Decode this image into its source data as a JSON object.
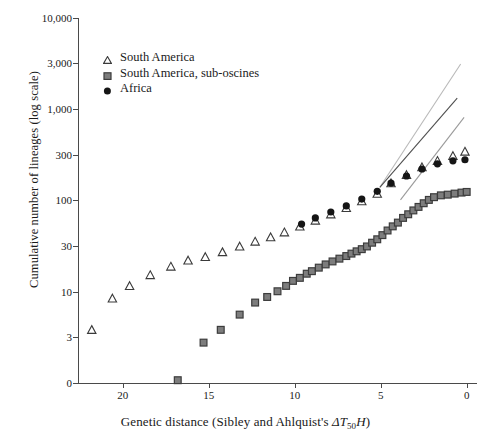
{
  "chart_data": {
    "type": "scatter",
    "title": "",
    "xlabel": "Genetic distance (Sibley and Ahlquist's ΔT50H)",
    "ylabel": "Cumulative number of lineages (log scale)",
    "xlim": [
      22.6,
      -0.6
    ],
    "x_reversed": true,
    "xticks": [
      20,
      15,
      10,
      5,
      0
    ],
    "xtick_labels": [
      "20",
      "15",
      "10",
      "5",
      "0"
    ],
    "yscale": "log",
    "ylim": [
      1,
      10000
    ],
    "yticks": [
      10000,
      3000,
      1000,
      300,
      100,
      30,
      10,
      3,
      0
    ],
    "ytick_labels": [
      "10,000",
      "3,000",
      "1,000",
      "300",
      "100",
      "30",
      "10",
      "3",
      "0"
    ],
    "grid": false,
    "legend_position": "upper-left",
    "series": [
      {
        "name": "South America",
        "marker": "triangle",
        "color": "#ffffff",
        "edge_color": "#3a3a3a",
        "points": [
          [
            21.8,
            3.6
          ],
          [
            20.6,
            8.0
          ],
          [
            19.6,
            11.0
          ],
          [
            18.4,
            14.5
          ],
          [
            17.2,
            18.0
          ],
          [
            16.2,
            21.0
          ],
          [
            15.2,
            23.0
          ],
          [
            14.2,
            26.0
          ],
          [
            13.2,
            30.0
          ],
          [
            12.3,
            34.0
          ],
          [
            11.4,
            38.0
          ],
          [
            10.6,
            43.0
          ],
          [
            9.7,
            50.0
          ],
          [
            8.8,
            58.0
          ],
          [
            7.9,
            68.0
          ],
          [
            7.0,
            80.0
          ],
          [
            6.1,
            95.0
          ],
          [
            5.2,
            115.0
          ],
          [
            4.4,
            150.0
          ],
          [
            3.5,
            185.0
          ],
          [
            2.6,
            225.0
          ],
          [
            1.7,
            265.0
          ],
          [
            0.8,
            300.0
          ],
          [
            0.1,
            335.0
          ]
        ]
      },
      {
        "name": "South America, sub-oscines",
        "marker": "square",
        "color": "#7d7d7d",
        "edge_color": "#3c3c3c",
        "points": [
          [
            16.8,
            1.0
          ],
          [
            15.3,
            2.6
          ],
          [
            14.3,
            3.6
          ],
          [
            13.2,
            5.3
          ],
          [
            12.3,
            7.2
          ],
          [
            11.6,
            8.3
          ],
          [
            11.0,
            9.6
          ],
          [
            10.5,
            11.0
          ],
          [
            10.1,
            12.5
          ],
          [
            9.7,
            13.5
          ],
          [
            9.3,
            15.0
          ],
          [
            9.0,
            16.0
          ],
          [
            8.6,
            17.5
          ],
          [
            8.2,
            19.0
          ],
          [
            7.8,
            20.5
          ],
          [
            7.4,
            22.0
          ],
          [
            7.0,
            23.5
          ],
          [
            6.7,
            25.0
          ],
          [
            6.4,
            26.5
          ],
          [
            6.1,
            28.0
          ],
          [
            5.8,
            30.0
          ],
          [
            5.5,
            33.0
          ],
          [
            5.2,
            36.0
          ],
          [
            4.9,
            40.0
          ],
          [
            4.6,
            45.0
          ],
          [
            4.3,
            50.0
          ],
          [
            4.0,
            55.0
          ],
          [
            3.7,
            62.0
          ],
          [
            3.4,
            68.0
          ],
          [
            3.1,
            75.0
          ],
          [
            2.8,
            82.0
          ],
          [
            2.5,
            90.0
          ],
          [
            2.2,
            98.0
          ],
          [
            1.9,
            105.0
          ],
          [
            1.5,
            110.0
          ],
          [
            1.1,
            112.0
          ],
          [
            0.7,
            115.0
          ],
          [
            0.3,
            118.0
          ],
          [
            0.0,
            120.0
          ]
        ]
      },
      {
        "name": "Africa",
        "marker": "circle",
        "color": "#151515",
        "edge_color": "#151515",
        "points": [
          [
            9.6,
            53.0
          ],
          [
            8.8,
            62.0
          ],
          [
            7.9,
            72.0
          ],
          [
            7.0,
            84.0
          ],
          [
            6.1,
            100.0
          ],
          [
            5.2,
            122.0
          ],
          [
            4.4,
            150.0
          ],
          [
            3.5,
            180.0
          ],
          [
            2.6,
            215.0
          ],
          [
            1.7,
            245.0
          ],
          [
            0.8,
            265.0
          ],
          [
            0.1,
            272.0
          ]
        ]
      }
    ],
    "trend_lines": [
      {
        "name": "trend-line-upper",
        "color": "#b9b9b9",
        "start": [
          5.05,
          135.0
        ],
        "end": [
          0.35,
          3100.0
        ]
      },
      {
        "name": "trend-line-middle",
        "color": "#4f4f4f",
        "start": [
          5.05,
          135.0
        ],
        "end": [
          0.55,
          1300.0
        ]
      },
      {
        "name": "trend-line-lower",
        "color": "#9a9a9a",
        "start": [
          3.85,
          98.0
        ],
        "end": [
          0.15,
          800.0
        ]
      }
    ]
  },
  "legend": {
    "items": [
      {
        "label": "South America",
        "marker": "triangle"
      },
      {
        "label": "South America, sub-oscines",
        "marker": "square"
      },
      {
        "label": "Africa",
        "marker": "circle"
      }
    ]
  },
  "axes": {
    "y_title": "Cumulative number of lineages (log scale)",
    "x_title_prefix": "Genetic distance (Sibley and Ahlquist's ",
    "x_title_delta": "ΔT",
    "x_title_sub": "50",
    "x_title_h": "H",
    "x_title_suffix": ")"
  }
}
